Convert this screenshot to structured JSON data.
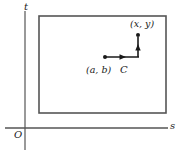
{
  "figure": {
    "type": "math-diagram",
    "background_color": "#ffffff",
    "ink_color": "#1a1a1a",
    "axis_color": "#555555",
    "rect_color": "#555555",
    "width": 180,
    "height": 152
  },
  "axes": {
    "vertical": {
      "label": "t",
      "x": 25,
      "y_top": 11,
      "y_bottom": 150,
      "label_x": 24,
      "label_y": 2
    },
    "horizontal": {
      "label": "s",
      "y": 128,
      "x_left": 5,
      "x_right": 168,
      "label_x": 170,
      "label_y": 121
    },
    "origin": {
      "label": "O",
      "x": 14,
      "y": 130
    }
  },
  "region": {
    "name": "rectangle",
    "x": 39,
    "y": 16,
    "width": 127,
    "height": 97,
    "stroke_width": 1.6
  },
  "path": {
    "label": "C",
    "label_x": 120,
    "label_y": 65,
    "stroke_width": 1.6,
    "start_point": {
      "label": "(a, b)",
      "x": 105,
      "y": 57,
      "label_x": 86,
      "label_y": 65,
      "dot_radius": 2.0
    },
    "end_point": {
      "label": "(x, y)",
      "x": 138,
      "y": 35,
      "label_x": 130,
      "label_y": 19,
      "dot_radius": 2.0
    },
    "segments": [
      {
        "name": "horizontal-segment",
        "x1": 105,
        "y1": 57,
        "x2": 139,
        "y2": 57,
        "arrow_at": 0.62
      },
      {
        "name": "vertical-segment",
        "x1": 138,
        "y1": 57,
        "x2": 138,
        "y2": 37,
        "arrow_at": 0.55
      }
    ]
  }
}
